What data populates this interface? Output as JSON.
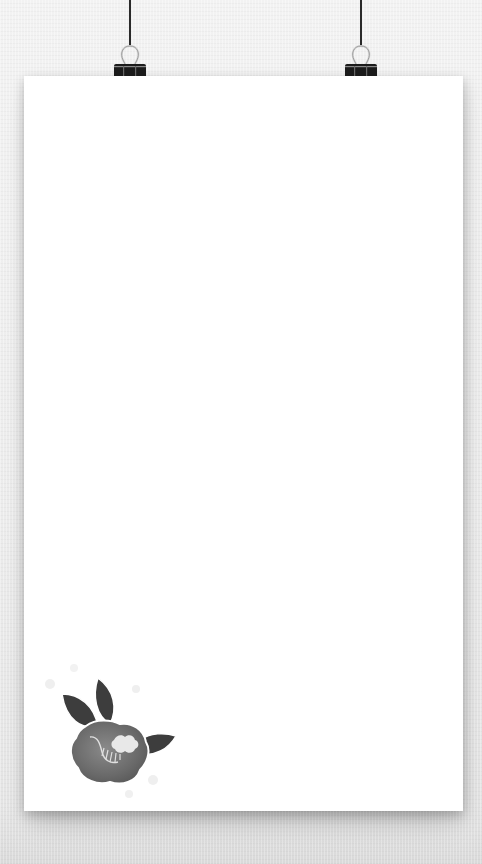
{
  "scene": {
    "description": "Blank white poster paper hanging from two black binder clips on a light gray textured wall",
    "background_color": "#ececec",
    "paper_color": "#ffffff"
  },
  "clips": [
    {
      "name": "left-binder-clip",
      "x": 130,
      "color": "#1c1c1c"
    },
    {
      "name": "right-binder-clip",
      "x": 361,
      "color": "#1c1c1c"
    }
  ],
  "decoration": {
    "name": "camellia-flower-illustration",
    "leaf_color": "#3d3d3d",
    "petal_color": "#6e6e6e",
    "highlight_color": "#e8e8e8"
  }
}
